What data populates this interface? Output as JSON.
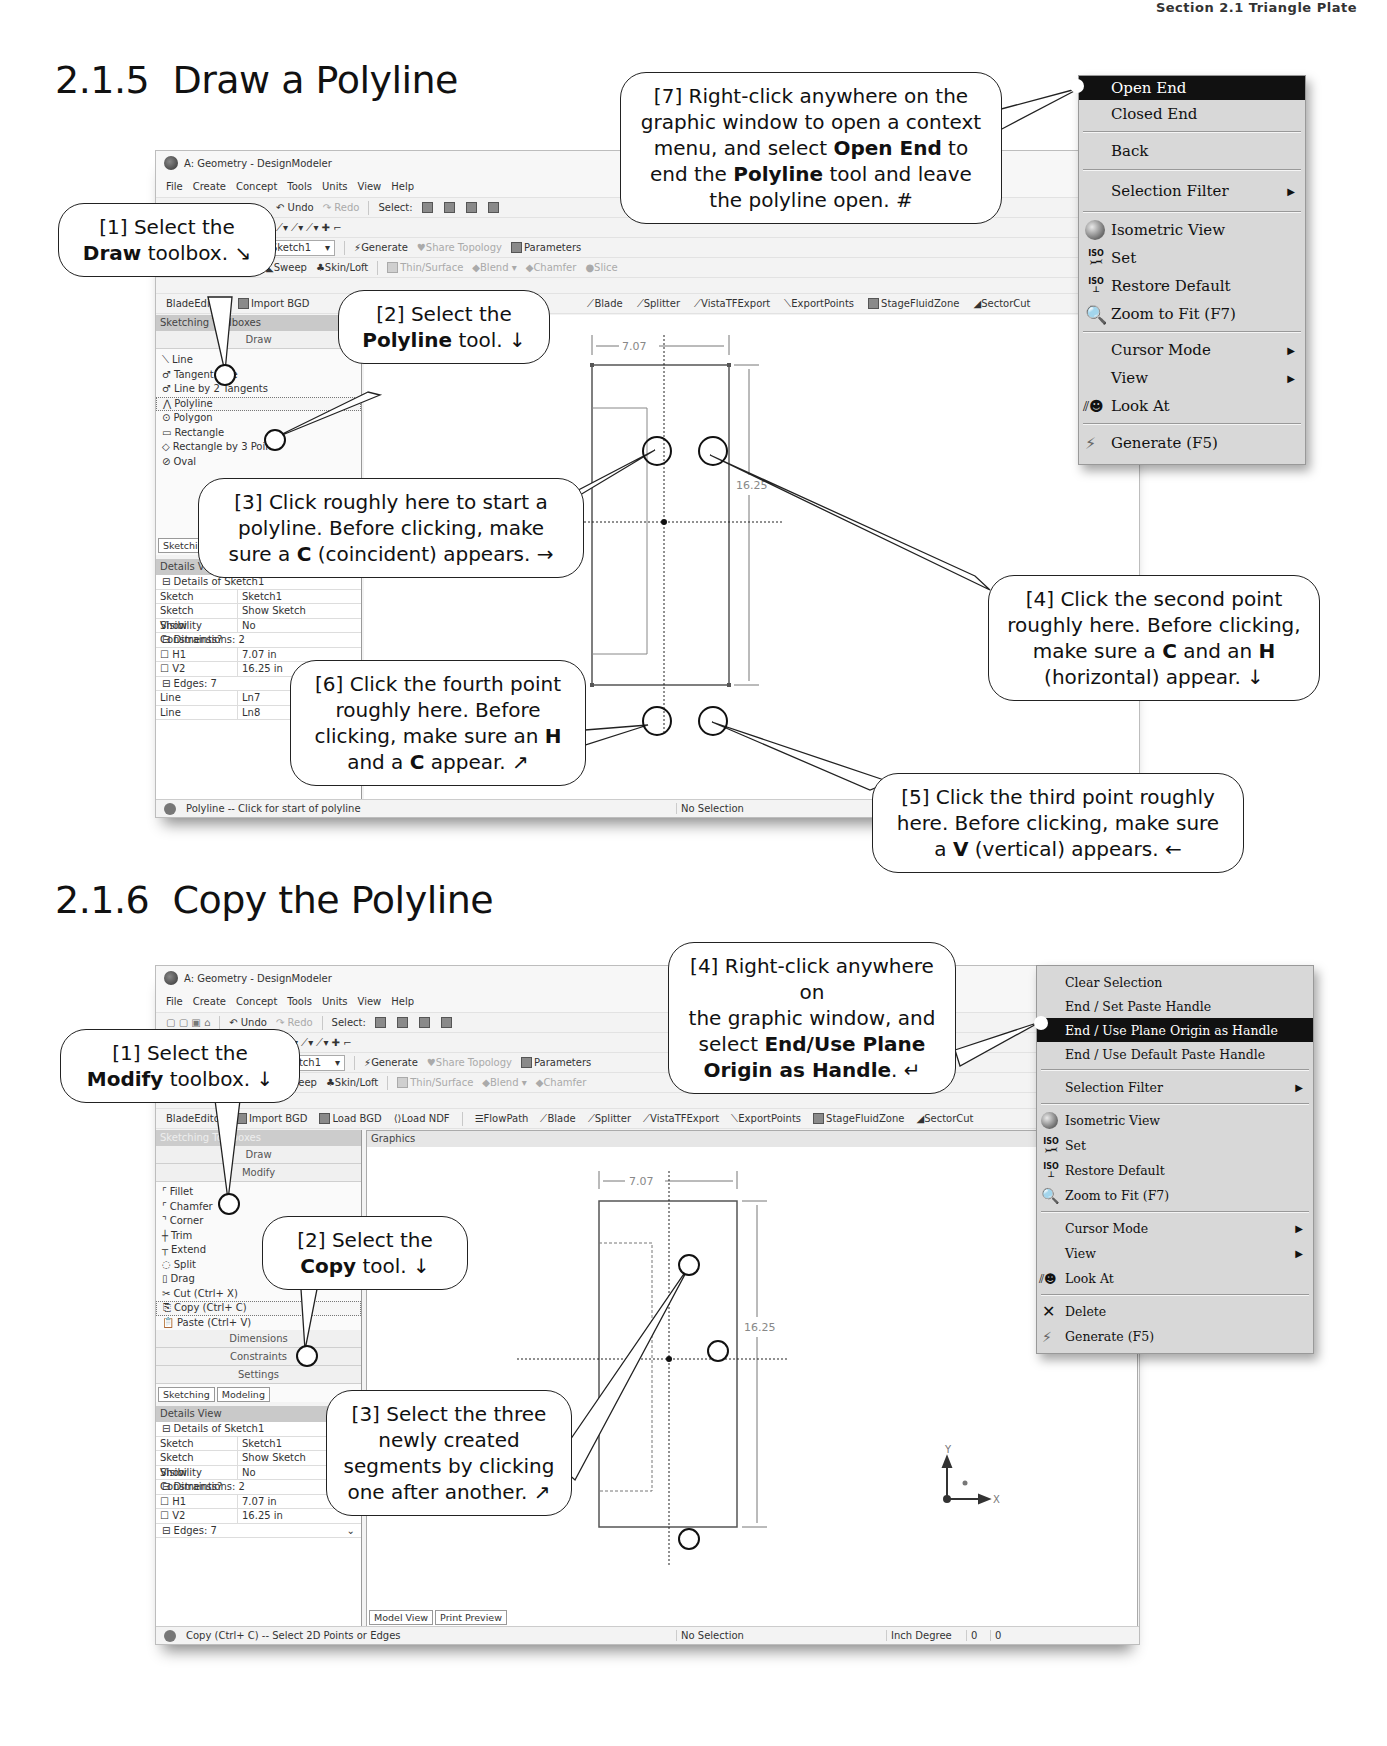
{
  "page": {
    "running_header": "Section 2.1  Triangle Plate",
    "sections": [
      {
        "number": "2.1.5",
        "title": "Draw a Polyline"
      },
      {
        "number": "2.1.6",
        "title": "Copy the Polyline"
      }
    ]
  },
  "app": {
    "window_title": "A: Geometry - DesignModeler",
    "menu": [
      "File",
      "Create",
      "Concept",
      "Tools",
      "Units",
      "View",
      "Help"
    ],
    "toolbar1": {
      "undo": "Undo",
      "redo": "Redo",
      "select": "Select:"
    },
    "toolbar3": {
      "sketch_dropdown": "Sketch1",
      "generate": "Generate",
      "share_topology": "Share Topology",
      "parameters": "Parameters"
    },
    "toolbar4": {
      "sweep": "Sweep",
      "skin_loft": "Skin/Loft",
      "thin_surface": "Thin/Surface",
      "blend": "Blend",
      "chamfer": "Chamfer",
      "slice": "Slice"
    },
    "bladegen_toolbar": [
      "BladeEditor",
      "Import BGD",
      "Load BGD",
      "Load NDF",
      "FlowPath",
      "Blade",
      "Splitter",
      "VistaTFExport",
      "ExportPoints",
      "StageFluidZone",
      "SectorCut"
    ],
    "sketching_toolboxes_label": "Sketching Toolboxes",
    "graphics_label": "Graphics",
    "details_view_label": "Details View",
    "pin_icon": "4",
    "dimension_h": "7.07",
    "dimension_v": "16.25",
    "status_no_selection": "No Selection",
    "tabs_left": [
      "Sketching",
      "Modeling"
    ],
    "tabs_bottom": [
      "Model View",
      "Print Preview"
    ],
    "units": "Inch  Degree",
    "coords": [
      "0",
      "0"
    ],
    "axis_labels": {
      "x": "X",
      "y": "Y"
    }
  },
  "shot1": {
    "draw_toolbox_label": "Draw",
    "draw_tools": [
      "Line",
      "Tangent Line",
      "Line by 2 Tangents",
      "Polyline",
      "Polygon",
      "Rectangle",
      "Rectangle by 3 Points",
      "Oval"
    ],
    "details": {
      "header": "Details of Sketch1",
      "rows": [
        {
          "k": "Sketch",
          "v": "Sketch1"
        },
        {
          "k": "Sketch Visibility",
          "v": "Show Sketch"
        },
        {
          "k": "Show Constraints?",
          "v": "No"
        }
      ],
      "dimensions_header": "Dimensions: 2",
      "dimensions": [
        {
          "k": "H1",
          "v": "7.07 in"
        },
        {
          "k": "V2",
          "v": "16.25 in"
        }
      ],
      "edges_header": "Edges: 7",
      "edges": [
        {
          "k": "Line",
          "v": "Ln7"
        },
        {
          "k": "Line",
          "v": "Ln8"
        }
      ]
    },
    "status_prompt": "Polyline -- Click for start of polyline",
    "context_menu": [
      {
        "label": "Open End",
        "active": true
      },
      {
        "label": "Closed End"
      },
      {
        "sep": true
      },
      {
        "label": "Back"
      },
      {
        "sep": true
      },
      {
        "label": "Selection Filter",
        "submenu": true
      },
      {
        "sep": true
      },
      {
        "label": "Isometric View",
        "icon": "sphere"
      },
      {
        "label": "Set",
        "icon": "iso"
      },
      {
        "label": "Restore Default",
        "icon": "iso"
      },
      {
        "label": "Zoom to Fit (F7)",
        "icon": "zoom"
      },
      {
        "sep": true
      },
      {
        "label": "Cursor Mode",
        "submenu": true
      },
      {
        "label": "View",
        "submenu": true
      },
      {
        "label": "Look At",
        "icon": "look"
      },
      {
        "sep": true
      },
      {
        "label": "Generate (F5)",
        "icon": "generate"
      }
    ],
    "callouts": {
      "c1": {
        "pre": "[1] Select the",
        "bold": "Draw",
        "post": "toolbox. ↘"
      },
      "c2": {
        "pre": "[2] Select the",
        "bold": "Polyline",
        "post": "tool. ↓"
      },
      "c3": {
        "l1": "[3] Click roughly here to start a",
        "l2": "polyline.  Before clicking, make",
        "pre3": "sure a ",
        "bold": "C",
        "post3": " (coincident) appears. →"
      },
      "c4": {
        "l1": "[4] Click the second point",
        "l2": "roughly here.  Before clicking,",
        "pre3": "make sure a ",
        "b1": "C",
        "mid3": " and an ",
        "b2": "H",
        "l4": "(horizontal) appear. ↓"
      },
      "c5": {
        "l1": "[5] Click the third point roughly",
        "l2": "here.  Before clicking, make sure",
        "pre3": "a ",
        "bold": "V",
        "post3": " (vertical) appears. ←"
      },
      "c6": {
        "l1": "[6] Click the fourth point",
        "l2": "roughly here.  Before",
        "pre3": "clicking, make sure an ",
        "b1": "H",
        "pre4": "and a ",
        "b2": "C",
        "post4": " appear. ↗"
      },
      "c7": {
        "l1": "[7] Right-click anywhere on the",
        "l2": "graphic window to open a context",
        "pre3": "menu, and select ",
        "b1": "Open End",
        "post3": " to",
        "pre4": "end the ",
        "b2": "Polyline",
        "post4": " tool and leave",
        "l5": "the polyline open.  #"
      }
    }
  },
  "shot2": {
    "toolbox_buttons_top": [
      "Draw",
      "Modify"
    ],
    "modify_tools": [
      "Fillet",
      "Chamfer",
      "Corner",
      "Trim",
      "Extend",
      "Split",
      "Drag",
      "Cut (Ctrl+ X)",
      "Copy (Ctrl+ C)",
      "Paste (Ctrl+ V)"
    ],
    "toolbox_buttons_bottom": [
      "Dimensions",
      "Constraints",
      "Settings"
    ],
    "details": {
      "header": "Details of Sketch1",
      "rows": [
        {
          "k": "Sketch",
          "v": "Sketch1"
        },
        {
          "k": "Sketch Visibility",
          "v": "Show Sketch"
        },
        {
          "k": "Show Constraints?",
          "v": "No"
        }
      ],
      "dimensions_header": "Dimensions: 2",
      "dimensions": [
        {
          "k": "H1",
          "v": "7.07 in"
        },
        {
          "k": "V2",
          "v": "16.25 in"
        }
      ],
      "edges_header": "Edges: 7"
    },
    "status_prompt": "Copy (Ctrl+ C) -- Select 2D Points or Edges",
    "context_menu": [
      {
        "label": "Clear Selection"
      },
      {
        "label": "End / Set Paste Handle"
      },
      {
        "label": "End / Use Plane Origin as Handle",
        "active": true
      },
      {
        "label": "End / Use Default Paste Handle"
      },
      {
        "sep": true
      },
      {
        "label": "Selection Filter",
        "submenu": true
      },
      {
        "sep": true
      },
      {
        "label": "Isometric View",
        "icon": "sphere"
      },
      {
        "label": "Set",
        "icon": "iso"
      },
      {
        "label": "Restore Default",
        "icon": "iso"
      },
      {
        "label": "Zoom to Fit (F7)",
        "icon": "zoom"
      },
      {
        "sep": true
      },
      {
        "label": "Cursor Mode",
        "submenu": true
      },
      {
        "label": "View",
        "submenu": true
      },
      {
        "label": "Look At",
        "icon": "look"
      },
      {
        "sep": true
      },
      {
        "label": "Delete",
        "icon": "delete"
      },
      {
        "label": "Generate (F5)",
        "icon": "generate"
      }
    ],
    "callouts": {
      "c1": {
        "pre": "[1] Select the",
        "bold": "Modify",
        "post": "toolbox. ↓"
      },
      "c2": {
        "pre": "[2] Select the",
        "bold": "Copy",
        "post": "tool. ↓"
      },
      "c3": {
        "l1": "[3] Select the three",
        "l2": "newly created",
        "l3": "segments by clicking",
        "l4": "one after another. ↗"
      },
      "c4": {
        "l1": "[4] Right-click anywhere on",
        "l2": "the graphic window, and",
        "pre3": "select ",
        "b1": "End/Use Plane",
        "b2": "Origin as Handle",
        "post4": ". ↵"
      }
    }
  }
}
